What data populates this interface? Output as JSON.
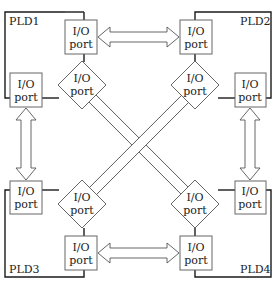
{
  "colors": {
    "frame": "#1a1a1a",
    "box": "#666666",
    "arrow": "#555555",
    "text": "#222222"
  },
  "plds": [
    {
      "id": "PLD1",
      "label": "PLD1"
    },
    {
      "id": "PLD2",
      "label": "PLD2"
    },
    {
      "id": "PLD3",
      "label": "PLD3"
    },
    {
      "id": "PLD4",
      "label": "PLD4"
    }
  ],
  "port": {
    "line1": "I/O",
    "line2": "port"
  },
  "connections": [
    {
      "from": "PLD1",
      "to": "PLD2",
      "type": "bidirectional",
      "orientation": "horizontal"
    },
    {
      "from": "PLD3",
      "to": "PLD4",
      "type": "bidirectional",
      "orientation": "horizontal"
    },
    {
      "from": "PLD1",
      "to": "PLD3",
      "type": "bidirectional",
      "orientation": "vertical"
    },
    {
      "from": "PLD2",
      "to": "PLD4",
      "type": "bidirectional",
      "orientation": "vertical"
    },
    {
      "from": "PLD1",
      "to": "PLD4",
      "type": "bidirectional",
      "orientation": "diagonal"
    },
    {
      "from": "PLD2",
      "to": "PLD3",
      "type": "bidirectional",
      "orientation": "diagonal"
    }
  ]
}
